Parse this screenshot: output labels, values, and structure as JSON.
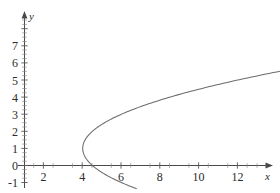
{
  "chart_data": {
    "type": "line",
    "title": "",
    "subtitle": "",
    "xlabel": "x",
    "ylabel": "y",
    "xlim": [
      -0.3,
      13.0
    ],
    "ylim": [
      -1.45,
      7.7
    ],
    "grid": false,
    "legend": false,
    "legend_position": "none",
    "x_ticks_major": [
      2,
      4,
      6,
      8,
      10,
      12
    ],
    "x_tick_labels": [
      "2",
      "4",
      "6",
      "8",
      "10",
      "12"
    ],
    "x_ticks_minor_step": 0.5,
    "y_ticks_major": [
      -1,
      0,
      1,
      2,
      3,
      4,
      5,
      6,
      7
    ],
    "y_tick_labels": [
      "-1",
      "0",
      "1",
      "2",
      "3",
      "4",
      "5",
      "6",
      "7"
    ],
    "y_ticks_minor_step": 0.25,
    "series": [
      {
        "name": "sideways-parabola",
        "equation": "x = 0.5*(y - 1)^2 + 3",
        "color": "#6b6b6b",
        "vertex": [
          3,
          1
        ],
        "x_intercept": 3.5,
        "points": [
          {
            "x": 3.5,
            "y": -1.0
          },
          {
            "x": 3.28,
            "y": -0.75
          },
          {
            "x": 3.125,
            "y": -0.5
          },
          {
            "x": 3.03,
            "y": -0.25
          },
          {
            "x": 3.0,
            "y": 0.0
          },
          {
            "x": 3.03,
            "y": 0.25
          },
          {
            "x": 3.125,
            "y": 0.5
          },
          {
            "x": 3.0,
            "y": 1.0
          },
          {
            "x": 3.125,
            "y": 1.5
          },
          {
            "x": 3.5,
            "y": 2.0
          },
          {
            "x": 4.125,
            "y": 2.5
          },
          {
            "x": 5.0,
            "y": 3.0
          },
          {
            "x": 6.125,
            "y": 3.5
          },
          {
            "x": 7.5,
            "y": 4.0
          },
          {
            "x": 8.0,
            "y": 4.2
          },
          {
            "x": 9.125,
            "y": 4.5
          },
          {
            "x": 10.5,
            "y": 4.75
          },
          {
            "x": 11.0,
            "y": 5.0
          },
          {
            "x": 12.0,
            "y": 5.5
          },
          {
            "x": 12.0,
            "y": 6.0
          },
          {
            "x": 12.0,
            "y": 7.0
          }
        ]
      }
    ],
    "axes_style": {
      "axis_color": "#4a4a4a",
      "curve_color": "#6b6b6b",
      "background": "#ffffff",
      "arrows": true,
      "origin": [
        3,
        0
      ]
    }
  },
  "axis_labels": {
    "x_name": "x",
    "y_name": "y"
  }
}
